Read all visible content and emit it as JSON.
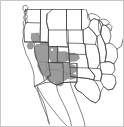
{
  "figure": {
    "kind": "choropleth-map",
    "region_name": "Western United States",
    "width_px": 124,
    "height_px": 127,
    "background_color": "#ffffff",
    "frame_color": "#c8c8c8",
    "boundary_color": "#3c3c3c",
    "coast_color": "#555555",
    "highlight_fill": "#9b9b9b",
    "unhighlighted_fill": "#ffffff",
    "has_labels": false,
    "has_legend": false,
    "has_title": false,
    "has_axes": false
  },
  "map_data": {
    "type": "choropleth",
    "projection": "albers-like",
    "title": "",
    "legend": [],
    "highlighted_regions": [
      "Nevada",
      "Utah",
      "Arizona",
      "eastern California",
      "southern Oregon",
      "western Colorado",
      "western New Mexico",
      "southern Idaho"
    ],
    "visible_features": [
      "state-boundaries",
      "pacific-coastline",
      "gulf-of-california",
      "baja-california-peninsula",
      "great-lakes",
      "gulf-of-mexico",
      "us-mexico-border",
      "us-canada-border"
    ],
    "shapes": {
      "outline": "M 82 6 L 86 5 L 88 8 L 87 12 L 90 15 L 89 19 L 92 18 L 93 13 L 96 12 L 97 16 L 95 21 L 97 24 L 100 22 L 103 25 L 106 23 L 108 26 L 112 25 L 115 28 L 118 26 L 122 29 L 123 35 L 122 44 L 123 52 L 122 60 L 123 68 L 121 76 L 122 84 L 120 92 L 121 100 L 118 107 L 114 110 L 110 112 L 106 115 L 102 117 L 98 120 L 94 122 L 90 124 L 86 125 L 82 125 L 78 124 L 74 123 L 70 122 L 66 120 L 62 119 L 58 117 L 54 116 L 50 115 L 46 117 L 42 119 L 38 121 L 34 122 L 30 123 L 26 123",
      "west_coast": "M 24 10 L 25 14 L 24 18 L 26 22 L 25 27 L 24 32 L 23 37 L 22 42 L 21 47 L 20 52 L 21 57 L 23 62 L 25 67 L 27 71 L 29 75 L 31 79 L 33 83 L 34 87",
      "mexico_border": "M 34 87 L 40 88 L 46 89 L 52 90 L 58 90 L 64 90 L 70 90 L 76 90 L 82 90 L 88 90",
      "canada_border": "M 23 11 L 34 11 L 46 11 L 58 11 L 70 11 L 82 11 L 94 11 L 106 11 L 118 11"
    }
  },
  "highlighted_cells": [
    {
      "id": "sw-oregon-a",
      "state": "Oregon",
      "value": 1
    },
    {
      "id": "ne-california",
      "state": "California",
      "value": 1
    },
    {
      "id": "nevada-north",
      "state": "Nevada",
      "value": 1
    },
    {
      "id": "nevada-south",
      "state": "Nevada",
      "value": 1
    },
    {
      "id": "utah-west",
      "state": "Utah",
      "value": 1
    },
    {
      "id": "utah-east",
      "state": "Utah",
      "value": 1
    },
    {
      "id": "arizona-north",
      "state": "Arizona",
      "value": 1
    },
    {
      "id": "arizona-central",
      "state": "Arizona",
      "value": 1
    },
    {
      "id": "colorado-west",
      "state": "Colorado",
      "value": 1
    },
    {
      "id": "new-mexico-west",
      "state": "New Mexico",
      "value": 1
    },
    {
      "id": "idaho-south",
      "state": "Idaho",
      "value": 1
    }
  ]
}
